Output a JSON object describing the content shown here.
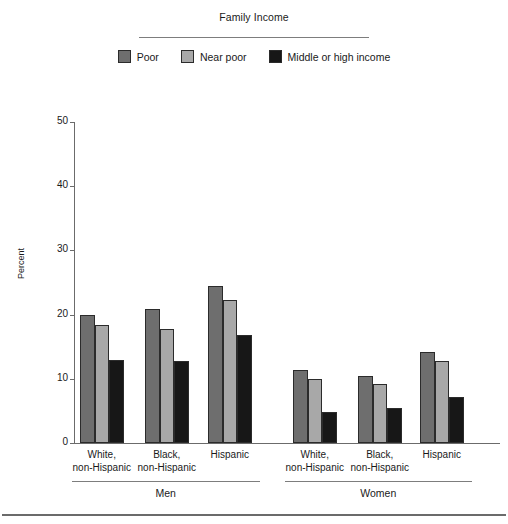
{
  "legend": {
    "title": "Family Income",
    "items": [
      {
        "label": "Poor",
        "color": "#6e6e6e",
        "name": "legend-swatch-poor"
      },
      {
        "label": "Near poor",
        "color": "#a8a8a8",
        "name": "legend-swatch-near-poor"
      },
      {
        "label": "Middle or high income",
        "color": "#171717",
        "name": "legend-swatch-middle-high"
      }
    ]
  },
  "chart_data": {
    "type": "bar",
    "title": "Family Income",
    "xlabel": "",
    "ylabel": "Percent",
    "ylim": [
      0,
      50
    ],
    "yticks": [
      0,
      10,
      20,
      30,
      40,
      50
    ],
    "grid": false,
    "legend_position": "top",
    "categories": [
      "White, non-Hispanic",
      "Black, non-Hispanic",
      "Hispanic",
      "White, non-Hispanic",
      "Black, non-Hispanic",
      "Hispanic"
    ],
    "category_lines": [
      [
        "White,",
        "non-Hispanic"
      ],
      [
        "Black,",
        "non-Hispanic"
      ],
      [
        "Hispanic",
        ""
      ],
      [
        "White,",
        "non-Hispanic"
      ],
      [
        "Black,",
        "non-Hispanic"
      ],
      [
        "Hispanic",
        ""
      ]
    ],
    "groups": [
      {
        "label": "Men",
        "categories": [
          0,
          1,
          2
        ]
      },
      {
        "label": "Women",
        "categories": [
          3,
          4,
          5
        ]
      }
    ],
    "series": [
      {
        "name": "Poor",
        "color": "#6e6e6e",
        "values": [
          20.0,
          20.9,
          24.4,
          11.4,
          10.5,
          14.1
        ]
      },
      {
        "name": "Near poor",
        "color": "#a8a8a8",
        "values": [
          18.4,
          17.7,
          22.3,
          9.9,
          9.2,
          12.8
        ]
      },
      {
        "name": "Middle or high income",
        "color": "#171717",
        "values": [
          12.9,
          12.7,
          16.9,
          4.8,
          5.4,
          7.1
        ]
      }
    ]
  }
}
